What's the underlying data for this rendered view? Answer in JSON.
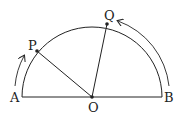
{
  "diagram": {
    "type": "semicircle-geometry",
    "labels": {
      "A": "A",
      "B": "B",
      "O": "O",
      "P": "P",
      "Q": "Q"
    },
    "points": {
      "A": [
        22,
        97
      ],
      "B": [
        162,
        97
      ],
      "O": [
        92,
        97
      ],
      "P": [
        37,
        51
      ],
      "Q": [
        107,
        24
      ]
    },
    "radius": 70,
    "segments": [
      [
        "A",
        "B"
      ],
      [
        "O",
        "P"
      ],
      [
        "O",
        "Q"
      ]
    ],
    "arrows": [
      {
        "name": "arrow-A-to-P",
        "direction": "counterclockwise along arc from A toward P"
      },
      {
        "name": "arrow-B-to-Q",
        "direction": "counterclockwise along arc from B toward Q"
      }
    ],
    "stroke_color": "#222222"
  }
}
